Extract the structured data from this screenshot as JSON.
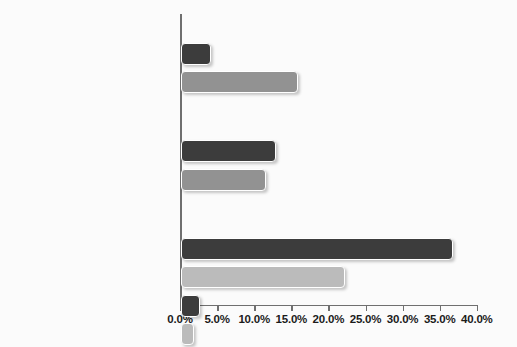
{
  "chart_data": {
    "type": "bar",
    "orientation": "horizontal",
    "title": "",
    "xlabel": "",
    "ylabel": "",
    "xlim": [
      0,
      40
    ],
    "xtick_labels": [
      "0.0%",
      "5.0%",
      "10.0%",
      "15.0%",
      "20.0%",
      "25.0%",
      "30.0%",
      "35.0%",
      "40.0%"
    ],
    "xticks": [
      0,
      5,
      10,
      15,
      20,
      25,
      30,
      35,
      40
    ],
    "grid": false,
    "legend": "none",
    "value_unit": "percent",
    "groups": [
      {
        "name": "Age:",
        "rows": [
          {
            "label": "16–24",
            "value": 4.1,
            "shade": "dark"
          },
          {
            "label": "55–64",
            "value": 15.8,
            "shade": "mid"
          }
        ]
      },
      {
        "name": "Sex:",
        "rows": [
          {
            "label": "Male",
            "value": 12.8,
            "shade": "dark"
          },
          {
            "label": "Female",
            "value": 11.4,
            "shade": "mid"
          }
        ]
      },
      {
        "name": "Industry:",
        "rows": [
          {
            "label": "Government",
            "value": 36.6,
            "shade": "dark"
          },
          {
            "label": "Transportation/utilities",
            "value": 22.1,
            "shade": "light"
          },
          {
            "label": "Professional/business services",
            "value": 2.6,
            "shade": "dark"
          },
          {
            "label": "Financial",
            "value": 1.7,
            "shade": "light"
          }
        ]
      }
    ],
    "categories": [
      "16–24",
      "55–64",
      "Male",
      "Female",
      "Government",
      "Transportation/utilities",
      "Professional/business services",
      "Financial"
    ],
    "values": [
      4.1,
      15.8,
      12.8,
      11.4,
      36.6,
      22.1,
      2.6,
      1.7
    ],
    "colors": {
      "dark": "#3c3c3c",
      "mid": "#929292",
      "light": "#bbbbbb",
      "axis": "#6f6f6f",
      "background": "#fbfbfb",
      "text": "#111111"
    }
  }
}
